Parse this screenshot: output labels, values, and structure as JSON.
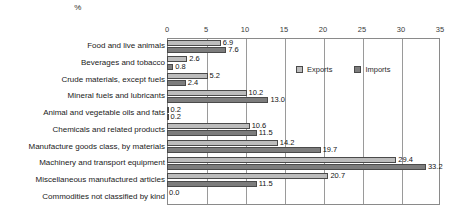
{
  "chart_data": {
    "type": "bar",
    "orientation": "horizontal",
    "title": "",
    "xlabel": "%",
    "ylabel": "",
    "xlim": [
      0,
      35
    ],
    "xticks": [
      0,
      5,
      10,
      15,
      20,
      25,
      30,
      35
    ],
    "xtick_labels": [
      "0",
      "5",
      "10",
      "15",
      "20",
      "25",
      "30",
      "35"
    ],
    "grid": true,
    "legend_position": "top-center-inside",
    "categories": [
      "Food and live animals",
      "Beverages and tobacco",
      "Crude materials, except fuels",
      "Mineral fuels and lubricants",
      "Animal and vegetable oils and fats",
      "Chemicals and related products",
      "Manufacture goods class, by materials",
      "Machinery and transport equipment",
      "Miscellaneous manufactured articles",
      "Commodities not classified by kind"
    ],
    "series": [
      {
        "name": "Exports",
        "color": "#bcbcbc",
        "values": [
          6.9,
          2.6,
          5.2,
          10.2,
          0.2,
          10.6,
          14.2,
          29.4,
          20.7,
          0.0
        ],
        "labels": [
          "6.9",
          "2.6",
          "5.2",
          "10.2",
          "0.2",
          "10.6",
          "14.2",
          "29.4",
          "20.7",
          "0.0"
        ]
      },
      {
        "name": "Imports",
        "color": "#7d7d7d",
        "values": [
          7.6,
          0.8,
          2.4,
          13.0,
          0.2,
          11.5,
          19.7,
          33.2,
          11.5,
          null
        ],
        "labels": [
          "7.6",
          "0.8",
          "2.4",
          "13.0",
          "0.2",
          "11.5",
          "19.7",
          "33.2",
          "11.5",
          ""
        ]
      }
    ]
  }
}
